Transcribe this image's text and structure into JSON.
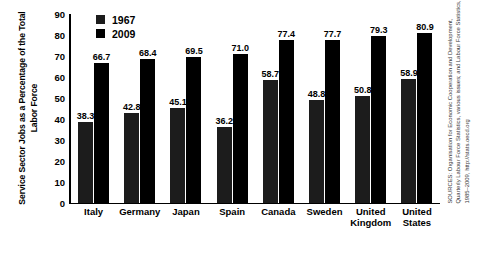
{
  "chart_data": {
    "type": "bar",
    "title": "",
    "xlabel": "",
    "ylabel": "Service Sector Jobs as a Percentage of the Total Labor Force",
    "ylim": [
      0,
      90
    ],
    "yticks": [
      90,
      80,
      70,
      60,
      50,
      40,
      30,
      20,
      10,
      0
    ],
    "grid": false,
    "legend_position": "top-left-inside",
    "categories": [
      "Italy",
      "Germany",
      "Japan",
      "Spain",
      "Canada",
      "Sweden",
      "United\nKingdom",
      "United\nStates"
    ],
    "series": [
      {
        "name": "1967",
        "color": "#1c1c1c",
        "values": [
          38.3,
          42.8,
          45.1,
          36.2,
          58.7,
          48.8,
          50.8,
          58.9
        ]
      },
      {
        "name": "2009",
        "color": "#000000",
        "values": [
          66.7,
          68.4,
          69.5,
          71.0,
          77.4,
          77.7,
          79.3,
          80.9
        ]
      }
    ],
    "source_lines": [
      "SOURCES: Organisation for Economic Cooperation and Development,",
      "Quarterly Labour Force Statistics, various issues; and Labour Force Statistics,",
      "1985–2009, http://stats.oecd.org"
    ]
  }
}
